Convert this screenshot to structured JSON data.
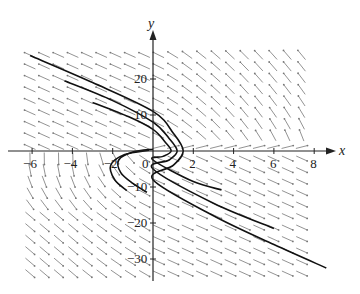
{
  "chart_data": {
    "type": "direction_field",
    "title": "",
    "xlabel": "x",
    "ylabel": "y",
    "xlim": [
      -6.5,
      8.5
    ],
    "ylim": [
      -36,
      33
    ],
    "x_ticks": [
      -6,
      -4,
      -2,
      0,
      2,
      4,
      6,
      8
    ],
    "x_tick_labels": [
      "−6",
      "−4",
      "−2",
      "0",
      "2",
      "4",
      "6",
      "8"
    ],
    "y_ticks": [
      -30,
      -20,
      -10,
      10,
      20
    ],
    "y_tick_labels": [
      "−30",
      "−20",
      "−10",
      "10",
      "20"
    ],
    "origin_label": "0",
    "grid": false,
    "legend": null,
    "field_region": {
      "x": [
        -6.2,
        8
      ],
      "y": [
        -34,
        27
      ]
    },
    "solution_curves": [
      {
        "name": "outer",
        "points": [
          [
            -6.1,
            26.5
          ],
          [
            -3,
            19
          ],
          [
            0,
            11
          ],
          [
            1.0,
            5
          ],
          [
            1.5,
            0
          ],
          [
            1.0,
            -4
          ],
          [
            0,
            -8
          ],
          [
            3,
            -18
          ],
          [
            6,
            -26
          ],
          [
            8.6,
            -32.5
          ]
        ]
      },
      {
        "name": "middle",
        "points": [
          [
            -4.4,
            19.5
          ],
          [
            -2,
            14
          ],
          [
            0,
            8
          ],
          [
            0.8,
            3.5
          ],
          [
            1.2,
            0
          ],
          [
            0.8,
            -2.5
          ],
          [
            0,
            -5
          ],
          [
            3,
            -14.5
          ],
          [
            6,
            -21.5
          ]
        ]
      },
      {
        "name": "inner",
        "points": [
          [
            -3,
            13.5
          ],
          [
            -1.2,
            9.5
          ],
          [
            0,
            6
          ],
          [
            0.6,
            2.5
          ],
          [
            0.9,
            0
          ],
          [
            0.5,
            -1.5
          ],
          [
            0,
            -2.5
          ],
          [
            2,
            -8.5
          ],
          [
            3.4,
            -10.8
          ]
        ]
      },
      {
        "name": "left-lower-1",
        "points": [
          [
            0,
            0.5
          ],
          [
            -1,
            -0.3
          ],
          [
            -1.7,
            -2.5
          ],
          [
            -1.6,
            -6
          ],
          [
            -1.0,
            -9
          ],
          [
            -0.3,
            -11.5
          ]
        ]
      },
      {
        "name": "left-lower-2",
        "points": [
          [
            -0.2,
            0.2
          ],
          [
            -1.4,
            -1
          ],
          [
            -2.1,
            -4
          ],
          [
            -1.9,
            -8
          ],
          [
            -1.3,
            -11
          ]
        ]
      }
    ]
  }
}
